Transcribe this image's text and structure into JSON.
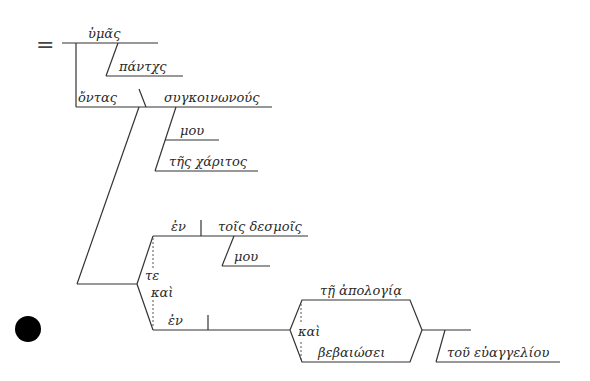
{
  "diagram": {
    "type": "sentence-diagram",
    "language": "Greek",
    "equals_sign": "=",
    "words": {
      "hymas": "ὑμᾶς",
      "pantas": "πάντχς",
      "ontas": "ὄντας",
      "synkoinonous": "συγκοινωνούς",
      "mou_1": "μου",
      "tes_charitos": "τῆς χάριτος",
      "en_1": "ἐν",
      "tois_desmois": "τοῖς δεσμοῖς",
      "mou_2": "μου",
      "te": "τε",
      "kai_1": "καὶ",
      "en_2": "ἐν",
      "te_apologia": "τῇ ἀπολογίᾳ",
      "kai_2": "καὶ",
      "bebaiosei": "βεβαιώσει",
      "tou_euangeliou": "τοῦ εὐαγγελίου"
    },
    "marker": {
      "shape": "circle",
      "color": "#000000"
    }
  }
}
